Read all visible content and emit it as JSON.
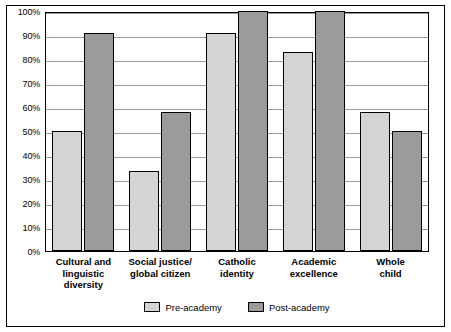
{
  "chart_data": {
    "type": "bar",
    "title": "",
    "xlabel": "",
    "ylabel": "",
    "ylim": [
      0,
      100
    ],
    "grid": true,
    "legend_position": "bottom",
    "categories": [
      "Cultural and linguistic diversity",
      "Social justice/ global citizen",
      "Catholic identity",
      "Academic excellence",
      "Whole child"
    ],
    "category_lines": [
      [
        "Cultural and",
        "linguistic",
        "diversity"
      ],
      [
        "Social justice/",
        "global citizen"
      ],
      [
        "Catholic",
        "identity"
      ],
      [
        "Academic",
        "excellence"
      ],
      [
        "Whole",
        "child"
      ]
    ],
    "y_ticks": [
      "0%",
      "10%",
      "20%",
      "30%",
      "40%",
      "50%",
      "60%",
      "70%",
      "80%",
      "90%",
      "100%"
    ],
    "y_tick_values": [
      0,
      10,
      20,
      30,
      40,
      50,
      60,
      70,
      80,
      90,
      100
    ],
    "series": [
      {
        "name": "Pre-academy",
        "color": "#d4d4d4",
        "values": [
          50,
          33.5,
          91,
          83,
          58
        ]
      },
      {
        "name": "Post-academy",
        "color": "#9b9b9b",
        "values": [
          91,
          58,
          100,
          100,
          50
        ]
      }
    ]
  },
  "legend": {
    "items": [
      {
        "label": "Pre-academy"
      },
      {
        "label": "Post-academy"
      }
    ]
  }
}
